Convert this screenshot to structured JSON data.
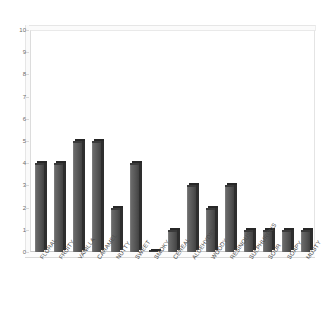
{
  "chart_data": {
    "type": "bar",
    "title": "",
    "subtitle": "",
    "xlabel": "",
    "ylabel": "",
    "ylim": [
      0,
      10
    ],
    "ytick_step": 1,
    "yticks": [
      "0",
      "1",
      "2",
      "3",
      "4",
      "5",
      "6",
      "7",
      "8",
      "9",
      "10"
    ],
    "grid": false,
    "legend": null,
    "legend_position": "none",
    "style": "3d-bar",
    "bar_color": "#4f4f4f",
    "bar_side_color": "#2e2e2e",
    "bar_top_color": "#272727",
    "axis_text_color": "#5a5a5a",
    "plot_background": "#ffffff",
    "categories": [
      "FLORAL",
      "FRUITY",
      "VANILLA",
      "CARAMEL",
      "NUTTY",
      "SWEET",
      "SMOKY",
      "CEREAL",
      "ALDEHYDIC",
      "WOODY",
      "RESINOUS",
      "SULPHUROUS",
      "SOUR",
      "SOAPY",
      "MUSTY"
    ],
    "values": [
      4,
      4,
      5,
      5,
      2,
      4,
      0,
      1,
      3,
      2,
      3,
      1,
      1,
      1,
      1
    ]
  }
}
